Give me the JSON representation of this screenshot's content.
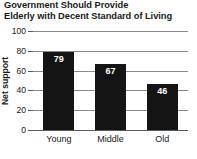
{
  "chart_data": {
    "type": "bar",
    "title": "Government Should Provide Elderly with Decent Standard of Living",
    "title_lines": [
      "Government Should Provide",
      "Elderly with Decent Standard of Living"
    ],
    "categories": [
      "Young",
      "Middle",
      "Old"
    ],
    "values": [
      79,
      67,
      46
    ],
    "value_labels": [
      "79",
      "67",
      "46"
    ],
    "xlabel": "",
    "ylabel": "Net support",
    "ylim": [
      0,
      100
    ],
    "yticks": [
      100,
      80,
      60,
      40,
      20,
      0
    ],
    "ytick_labels": [
      "100",
      "80",
      "60",
      "40",
      "20",
      "0"
    ],
    "grid": true,
    "legend": false,
    "bar_color": "#141414",
    "value_label_color": "#ffffff",
    "gridline_color": "#8a8a8a",
    "axis_color": "#5a5a5a",
    "text_color": "#1a1a1a",
    "background": "#ffffff"
  }
}
